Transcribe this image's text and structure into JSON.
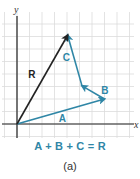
{
  "figure": {
    "axis_labels": {
      "x": "x",
      "y": "y"
    },
    "vectors": [
      {
        "name": "A",
        "label": "A",
        "from": [
          0,
          0
        ],
        "to": [
          7,
          2
        ],
        "color": "#2f86a6"
      },
      {
        "name": "B",
        "label": "B",
        "from": [
          7,
          2
        ],
        "to": [
          5.2,
          3.05
        ],
        "color": "#2f86a6"
      },
      {
        "name": "C",
        "label": "C",
        "from": [
          5.2,
          3.05
        ],
        "to": [
          4.05,
          7.1
        ],
        "color": "#2f86a6"
      },
      {
        "name": "R",
        "label": "R",
        "from": [
          0,
          0
        ],
        "to": [
          4.05,
          7.1
        ],
        "color": "#222222"
      }
    ],
    "grid": {
      "x_range": [
        -1,
        9
      ],
      "y_range": [
        -1,
        8
      ]
    },
    "equation": "A + B + C = R",
    "caption": "(a)"
  }
}
